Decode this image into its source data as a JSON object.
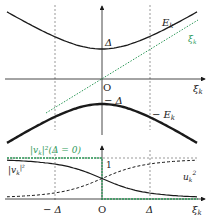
{
  "colors": {
    "curve": "#1a1a1a",
    "green": "#2f9a5a",
    "dashed_guide": "#555555"
  },
  "top_panel": {
    "curve_label": "E",
    "curve_label_sub": "k",
    "line_label": "ξ",
    "line_label_sub": "k",
    "gap_label": "Δ",
    "origin_label": "O",
    "axis_label": "ξ",
    "axis_label_sub": "k"
  },
  "middle_panel": {
    "gap_label": "− Δ",
    "curve_label": "− E",
    "curve_label_sub": "k"
  },
  "bottom_panel": {
    "green_label": "|v",
    "green_label_sub": "k",
    "green_label_rest": "|²(Δ = 0)",
    "v_label": "|v",
    "v_label_sub": "k",
    "v_label_sup": "|²",
    "u_label": "u",
    "u_label_sub": "k",
    "u_label_sup": "2",
    "one_label": "1",
    "neg_delta_label": "− Δ",
    "origin_label": "O",
    "delta_label": "Δ",
    "axis_label": "ξ",
    "axis_label_sub": "k"
  }
}
